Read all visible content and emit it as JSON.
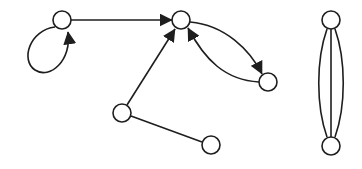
{
  "diagram": {
    "type": "graph",
    "colors": {
      "stroke": "#1e1e1e",
      "node_fill": "#ffffff",
      "background": "#ffffff"
    },
    "nodes": [
      {
        "id": "A",
        "x": 62,
        "y": 20,
        "r": 9
      },
      {
        "id": "B",
        "x": 181,
        "y": 20,
        "r": 9
      },
      {
        "id": "C",
        "x": 268,
        "y": 82,
        "r": 9
      },
      {
        "id": "D",
        "x": 122,
        "y": 113,
        "r": 9
      },
      {
        "id": "E",
        "x": 211,
        "y": 145,
        "r": 9
      },
      {
        "id": "F",
        "x": 331,
        "y": 20,
        "r": 9
      },
      {
        "id": "G",
        "x": 331,
        "y": 146,
        "r": 9
      }
    ],
    "edges": [
      {
        "id": "A-A",
        "from": "A",
        "to": "A",
        "directed": true,
        "kind": "self-loop"
      },
      {
        "id": "A-B",
        "from": "A",
        "to": "B",
        "directed": true,
        "kind": "straight"
      },
      {
        "id": "D-B",
        "from": "D",
        "to": "B",
        "directed": true,
        "kind": "straight"
      },
      {
        "id": "B-C",
        "from": "B",
        "to": "C",
        "directed": true,
        "kind": "curved-upper"
      },
      {
        "id": "C-B",
        "from": "C",
        "to": "B",
        "directed": true,
        "kind": "curved-lower"
      },
      {
        "id": "D-E",
        "from": "D",
        "to": "E",
        "directed": false,
        "kind": "straight"
      },
      {
        "id": "F-G-1",
        "from": "F",
        "to": "G",
        "directed": false,
        "kind": "curved-left"
      },
      {
        "id": "F-G-2",
        "from": "F",
        "to": "G",
        "directed": false,
        "kind": "straight"
      },
      {
        "id": "F-G-3",
        "from": "F",
        "to": "G",
        "directed": false,
        "kind": "curved-right"
      }
    ]
  }
}
